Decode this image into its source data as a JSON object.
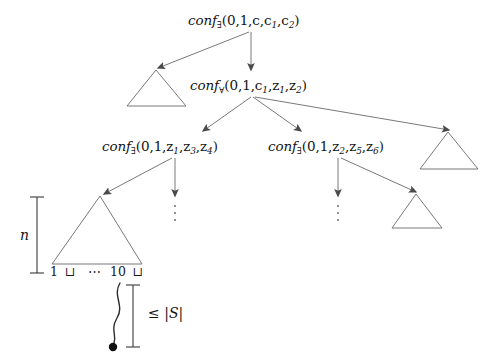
{
  "figure": {
    "type": "computation-tree-diagram",
    "background_color": "#ffffff",
    "stroke_color": "#5a5a5a",
    "text_color": "#131313"
  },
  "nodes": [
    {
      "id": "root",
      "name": "conf-exists-root",
      "text": "conf",
      "quantifier": "∃",
      "args": "(0,1,c,c",
      "arg_sub_1": "1",
      "arg_mid": ",c",
      "arg_sub_2": "2",
      "arg_close": ")",
      "full_text": "conf∃(0,1,c,c1,c2)",
      "x": 188,
      "y": 14
    },
    {
      "id": "level2",
      "name": "conf-forall",
      "text": "conf",
      "quantifier": "∀",
      "full_text": "conf∀(0,1,c1,z1,z2)",
      "x": 188,
      "y": 79
    },
    {
      "id": "level3-left",
      "name": "conf-exists-left",
      "text": "conf",
      "quantifier": "∃",
      "full_text": "conf∃(0,1,z1,z3,z4)",
      "x": 101,
      "y": 140
    },
    {
      "id": "level3-right",
      "name": "conf-exists-right",
      "text": "conf",
      "quantifier": "∃",
      "full_text": "conf∃(0,1,z2,z5,z6)",
      "x": 266,
      "y": 140
    }
  ],
  "labels": {
    "root_pre": "conf",
    "root_quant": "∃",
    "root_open": "(0,1,c,c",
    "root_s1": "1",
    "root_mid": ",c",
    "root_s2": "2",
    "root_close": ")",
    "l2_pre": "conf",
    "l2_quant": "∀",
    "l2_open": "(0,1,c",
    "l2_s1": "1",
    "l2_mid1": ",z",
    "l2_s2": "1",
    "l2_mid2": ",z",
    "l2_s3": "2",
    "l2_close": ")",
    "l3l_pre": "conf",
    "l3l_quant": "∃",
    "l3l_open": "(0,1,z",
    "l3l_s1": "1",
    "l3l_mid1": ",z",
    "l3l_s2": "3",
    "l3l_mid2": ",z",
    "l3l_s3": "4",
    "l3l_close": ")",
    "l3r_pre": "conf",
    "l3r_quant": "∃",
    "l3r_open": "(0,1,z",
    "l3r_s1": "2",
    "l3r_mid1": ",z",
    "l3r_s2": "5",
    "l3r_mid2": ",z",
    "l3r_s3": "6",
    "l3r_close": ")"
  },
  "triangles": [
    {
      "name": "subtree-triangle-upper-left",
      "x": 125,
      "y": 66,
      "width": 62,
      "height": 44
    },
    {
      "name": "subtree-triangle-right",
      "x": 424,
      "y": 128,
      "width": 62,
      "height": 44
    },
    {
      "name": "subtree-triangle-lower-right",
      "x": 394,
      "y": 190,
      "width": 52,
      "height": 38
    },
    {
      "name": "subtree-triangle-main",
      "x": 48,
      "y": 192,
      "width": 105,
      "height": 75
    }
  ],
  "ellipses": [
    {
      "name": "vertical-ellipsis-left",
      "x": 180,
      "y": 203,
      "dots": 3
    },
    {
      "name": "vertical-ellipsis-right",
      "x": 338,
      "y": 203,
      "dots": 3
    }
  ],
  "tape": {
    "name": "tape-contents",
    "cells": [
      "1",
      "⊔",
      "⋯",
      "1",
      "0",
      "⊔"
    ],
    "full_text": "1 ⊔ ⋯ 1 0 ⊔"
  },
  "measures": [
    {
      "name": "height-measure-n",
      "label": "n",
      "italic": true,
      "orientation": "vertical",
      "x": 38,
      "y": 196,
      "length": 76
    },
    {
      "name": "length-measure-s",
      "label": "≤ |S|",
      "prefix": "≤",
      "value": "|S|",
      "orientation": "vertical",
      "x": 133,
      "y": 285,
      "length": 64
    }
  ],
  "pointer": {
    "name": "head-pointer-curve",
    "description": "wavy line from tape cell to filled dot",
    "dot_radius": 4
  }
}
